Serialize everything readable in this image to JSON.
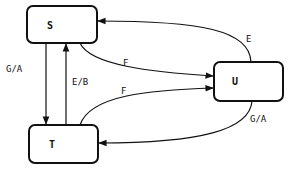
{
  "diagram": {
    "type": "state-machine",
    "nodes": [
      {
        "id": "S",
        "label": "S"
      },
      {
        "id": "U",
        "label": "U"
      },
      {
        "id": "T",
        "label": "T"
      }
    ],
    "edges": [
      {
        "from": "S",
        "to": "T",
        "label": "G/A"
      },
      {
        "from": "T",
        "to": "S",
        "label": "E/B"
      },
      {
        "from": "S",
        "to": "U",
        "label": "F"
      },
      {
        "from": "T",
        "to": "U",
        "label": "F"
      },
      {
        "from": "U",
        "to": "S",
        "label": "E"
      },
      {
        "from": "U",
        "to": "T",
        "label": "G/A"
      }
    ],
    "colors": {
      "stroke": "#111111",
      "background": "#ffffff"
    }
  }
}
